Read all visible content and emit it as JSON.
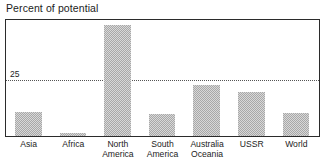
{
  "chart_data": {
    "type": "bar",
    "title": "Percent of potential",
    "xlabel": "",
    "ylabel": "",
    "categories": [
      "Asia",
      "Africa",
      "North\nAmerica",
      "South\nAmerica",
      "Australia\nOceania",
      "USSR",
      "World"
    ],
    "values": [
      11,
      1.3,
      50,
      10,
      23,
      20,
      10.5
    ],
    "ylim": [
      0,
      52
    ],
    "yticks": [
      25
    ],
    "ytick_labels": [
      "25"
    ],
    "grid": true,
    "gridlines_at": [
      25
    ],
    "legend": null,
    "bar_color": "#a8a8a8",
    "frame_color": "#2b2b2b",
    "text_color": "#1c1c1c"
  },
  "figure": {
    "title": "Percent of potential"
  }
}
